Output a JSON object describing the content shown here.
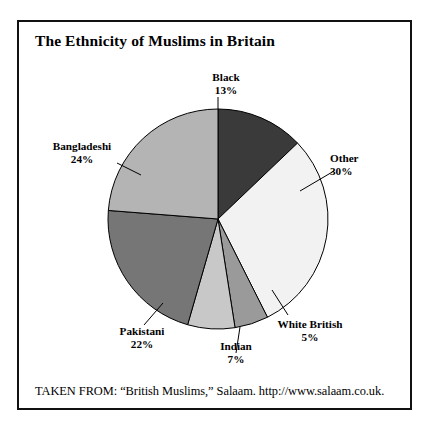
{
  "figure": {
    "title": "The Ethnicity of Muslims in Britain",
    "caption": "TAKEN FROM: “British Muslims,” Salaam. http://www.salaam.co.uk.",
    "border_color": "#111111",
    "background_color": "#ffffff"
  },
  "labels": {
    "black": {
      "name": "Black",
      "pct": "13%"
    },
    "other": {
      "name": "Other",
      "pct": "30%"
    },
    "white_british": {
      "name": "White British",
      "pct": "5%"
    },
    "indian": {
      "name": "Indian",
      "pct": "7%"
    },
    "pakistani": {
      "name": "Pakistani",
      "pct": "22%"
    },
    "bangladeshi": {
      "name": "Bangladeshi",
      "pct": "24%"
    }
  },
  "chart_data": {
    "type": "pie",
    "title": "The Ethnicity of Muslims in Britain",
    "xlabel": "",
    "ylabel": "",
    "legend": "none",
    "grid": false,
    "units": "percent",
    "total": 101,
    "start_angle_deg": 0,
    "direction": "clockwise",
    "categories": [
      "Black",
      "Other",
      "White British",
      "Indian",
      "Pakistani",
      "Bangladeshi"
    ],
    "values": [
      13,
      30,
      5,
      7,
      22,
      24
    ],
    "colors": [
      "#3a3a3a",
      "#f2f2f2",
      "#9a9a9a",
      "#c8c8c8",
      "#767676",
      "#b4b4b4"
    ],
    "slices": [
      {
        "label": "Black",
        "value": 13,
        "display": "13%",
        "color": "#3a3a3a"
      },
      {
        "label": "Other",
        "value": 30,
        "display": "30%",
        "color": "#f2f2f2"
      },
      {
        "label": "White British",
        "value": 5,
        "display": "5%",
        "color": "#9a9a9a"
      },
      {
        "label": "Indian",
        "value": 7,
        "display": "7%",
        "color": "#c8c8c8"
      },
      {
        "label": "Pakistani",
        "value": 22,
        "display": "22%",
        "color": "#767676"
      },
      {
        "label": "Bangladeshi",
        "value": 24,
        "display": "24%",
        "color": "#b4b4b4"
      }
    ],
    "geometry": {
      "cx": 218,
      "cy": 219,
      "r": 110,
      "outline_color": "#000000"
    },
    "leader_lines": [
      {
        "for": "Black",
        "x1": 218,
        "y1": 109,
        "x2": 218,
        "y2": 97
      },
      {
        "for": "Other",
        "x1": 300,
        "y1": 191,
        "x2": 334,
        "y2": 171
      },
      {
        "for": "White British",
        "x1": 272,
        "y1": 290,
        "x2": 288,
        "y2": 315
      },
      {
        "for": "Indian",
        "x1": 240,
        "y1": 327,
        "x2": 236,
        "y2": 353
      },
      {
        "for": "Pakistani",
        "x1": 163,
        "y1": 303,
        "x2": 144,
        "y2": 325
      },
      {
        "for": "Bangladeshi",
        "x1": 141,
        "y1": 175,
        "x2": 117,
        "y2": 163
      }
    ]
  }
}
